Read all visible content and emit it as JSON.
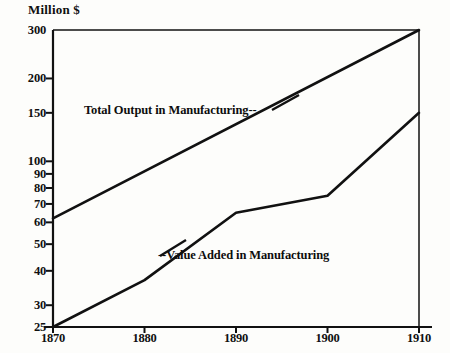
{
  "chart_data": {
    "type": "line",
    "title": "",
    "subtitle": "",
    "xlabel": "",
    "ylabel": "Million $",
    "yscale": "log",
    "ylim": [
      25,
      300
    ],
    "xlim": [
      1870,
      1910
    ],
    "grid": false,
    "legend_position": "inline-annotations",
    "x_ticks": [
      "1870",
      "1880",
      "1890",
      "1900",
      "1910"
    ],
    "y_ticks": [
      "25",
      "30",
      "40",
      "50",
      "60",
      "70",
      "80",
      "90",
      "100",
      "150",
      "200",
      "300"
    ],
    "series": [
      {
        "name": "Total Output in Manufacturing",
        "annotation": "Total Output in Manufacturing--",
        "x": [
          1870,
          1910
        ],
        "values": [
          62,
          300
        ]
      },
      {
        "name": "Value Added in Manufacturing",
        "annotation": "--Value Added in Manufacturing",
        "x": [
          1870,
          1880,
          1890,
          1900,
          1910
        ],
        "values": [
          25,
          37,
          65,
          75,
          150
        ]
      }
    ],
    "colors": {
      "line": "#111111",
      "axis": "#111111",
      "background": "#fdfdfb"
    }
  },
  "axis": {
    "unit_label": "Million $",
    "y_ticks": [
      {
        "label": "300",
        "value": 300
      },
      {
        "label": "200",
        "value": 200
      },
      {
        "label": "150",
        "value": 150
      },
      {
        "label": "100",
        "value": 100
      },
      {
        "label": "90",
        "value": 90
      },
      {
        "label": "80",
        "value": 80
      },
      {
        "label": "70",
        "value": 70
      },
      {
        "label": "60",
        "value": 60
      },
      {
        "label": "50",
        "value": 50
      },
      {
        "label": "40",
        "value": 40
      },
      {
        "label": "30",
        "value": 30
      },
      {
        "label": "25",
        "value": 25
      }
    ],
    "x_ticks": [
      {
        "label": "1870",
        "value": 1870
      },
      {
        "label": "1880",
        "value": 1880
      },
      {
        "label": "1890",
        "value": 1890
      },
      {
        "label": "1900",
        "value": 1900
      },
      {
        "label": "1910",
        "value": 1910
      }
    ]
  },
  "annotations": {
    "total_output": "Total Output in Manufacturing--",
    "value_added": "--Value Added in Manufacturing"
  }
}
